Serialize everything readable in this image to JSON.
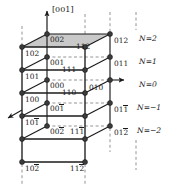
{
  "figure": {
    "axis": {
      "label": "[001]",
      "name": "c-axis-arrow"
    },
    "colors": {
      "line": "#1b1b1b",
      "node": "#3c3c3c",
      "shaded_face": "#c9c9c9",
      "dashed": "#6e6e6e",
      "background": "#ffffff"
    }
  },
  "layer_labels": [
    {
      "text": "N=2",
      "n": 2,
      "var": "N",
      "value": "2"
    },
    {
      "text": "N=1",
      "n": 1,
      "var": "N",
      "value": "1"
    },
    {
      "text": "N=0",
      "n": 0,
      "var": "N",
      "value": "0"
    },
    {
      "text": "N=−1",
      "n": -1,
      "var": "N",
      "value": "−1"
    },
    {
      "text": "N=−2",
      "n": -2,
      "var": "N",
      "value": "−2"
    }
  ],
  "miller_indices": {
    "top_face_left": {
      "plain": "002",
      "digits": [
        "0",
        "0",
        "2"
      ],
      "bars": [
        false,
        false,
        false
      ]
    },
    "top_face_right": {
      "plain": "112",
      "digits": [
        "1",
        "1",
        "2"
      ],
      "bars": [
        false,
        false,
        false
      ]
    },
    "right_n2": {
      "plain": "012",
      "digits": [
        "0",
        "1",
        "2"
      ],
      "bars": [
        false,
        false,
        false
      ]
    },
    "left_n1": {
      "plain": "102",
      "digits": [
        "1",
        "0",
        "2"
      ],
      "bars": [
        false,
        false,
        false
      ]
    },
    "inner_n1": {
      "plain": "001",
      "digits": [
        "0",
        "0",
        "1"
      ],
      "bars": [
        false,
        false,
        false
      ]
    },
    "mid_n1": {
      "plain": "111",
      "digits": [
        "1",
        "1",
        "1"
      ],
      "bars": [
        false,
        false,
        false
      ]
    },
    "right_n1": {
      "plain": "011",
      "digits": [
        "0",
        "1",
        "1"
      ],
      "bars": [
        false,
        false,
        false
      ]
    },
    "left_n0": {
      "plain": "101",
      "digits": [
        "1",
        "0",
        "1"
      ],
      "bars": [
        false,
        false,
        false
      ]
    },
    "inner_n0": {
      "plain": "000",
      "digits": [
        "0",
        "0",
        "0"
      ],
      "bars": [
        false,
        false,
        false
      ]
    },
    "mid_n0": {
      "plain": "110",
      "digits": [
        "1",
        "1",
        "0"
      ],
      "bars": [
        false,
        false,
        false
      ]
    },
    "right_n0": {
      "plain": "010",
      "digits": [
        "0",
        "1",
        "0"
      ],
      "bars": [
        false,
        false,
        false
      ]
    },
    "left_nm1": {
      "plain": "100",
      "digits": [
        "1",
        "0",
        "0"
      ],
      "bars": [
        false,
        false,
        false
      ]
    },
    "inner_nm1": {
      "plain": "001̄",
      "digits": [
        "0",
        "0",
        "1"
      ],
      "bars": [
        false,
        false,
        true
      ]
    },
    "right_nm1": {
      "plain": "011̄",
      "digits": [
        "0",
        "1",
        "1"
      ],
      "bars": [
        false,
        false,
        true
      ]
    },
    "left_nm2": {
      "plain": "101̄",
      "digits": [
        "1",
        "0",
        "1"
      ],
      "bars": [
        false,
        false,
        true
      ]
    },
    "inner_nm2": {
      "plain": "002̄",
      "digits": [
        "0",
        "0",
        "2"
      ],
      "bars": [
        false,
        false,
        true
      ]
    },
    "mid_nm2": {
      "plain": "111̄",
      "digits": [
        "1",
        "1",
        "1"
      ],
      "bars": [
        false,
        false,
        true
      ]
    },
    "right_nm2": {
      "plain": "012̄",
      "digits": [
        "0",
        "1",
        "2"
      ],
      "bars": [
        false,
        false,
        true
      ]
    },
    "bottom_left": {
      "plain": "102̄",
      "digits": [
        "1",
        "0",
        "2"
      ],
      "bars": [
        false,
        false,
        true
      ]
    },
    "bottom_mid": {
      "plain": "112̄",
      "digits": [
        "1",
        "1",
        "2"
      ],
      "bars": [
        false,
        false,
        true
      ]
    }
  }
}
